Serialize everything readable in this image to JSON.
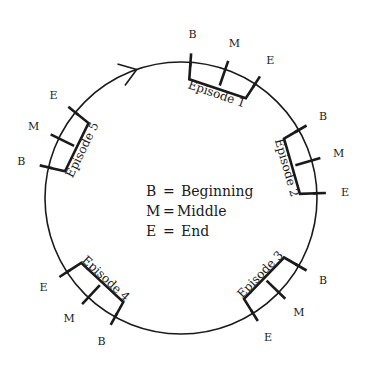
{
  "diagram": {
    "center": [
      181,
      198
    ],
    "radius": 136,
    "stroke_color": "#1a1a1a",
    "direction_arrow": {
      "angle": -109,
      "meaning": "clockwise"
    },
    "marker_labels": {
      "B": "B",
      "M": "M",
      "E": "E"
    },
    "episodes": [
      {
        "label": "Episode 1",
        "angles": {
          "B": -86,
          "M": -71,
          "E": -57
        }
      },
      {
        "label": "Episode 2",
        "angles": {
          "B": -30,
          "M": -16,
          "E": -2
        }
      },
      {
        "label": "Episode 3",
        "angles": {
          "B": 30,
          "M": 44,
          "E": 58
        }
      },
      {
        "label": "Episode 4",
        "angles": {
          "B": 119,
          "M": 133,
          "E": 147
        }
      },
      {
        "label": "Episode 5",
        "angles": {
          "B": -167,
          "M": -154,
          "E": -141
        }
      }
    ],
    "legend": [
      {
        "key": "B",
        "sep": "=",
        "value": "Beginning"
      },
      {
        "key": "M",
        "sep": "=",
        "value": "Middle"
      },
      {
        "key": "E",
        "sep": "=",
        "value": "End"
      }
    ]
  }
}
